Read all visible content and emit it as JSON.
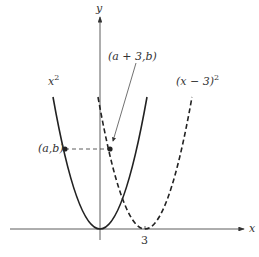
{
  "figure": {
    "axes": {
      "x_label": "x",
      "y_label": "y",
      "x_tick": "3"
    },
    "curves": [
      {
        "label_base": "x",
        "label_exp": "2",
        "style": "solid"
      },
      {
        "label_base": "(x − 3)",
        "label_exp": "2",
        "style": "dashed"
      }
    ],
    "points": [
      {
        "label": "(a,b)"
      },
      {
        "label": "(a + 3,b)"
      }
    ],
    "colors": {
      "ink": "#333333",
      "background": "#ffffff"
    }
  }
}
